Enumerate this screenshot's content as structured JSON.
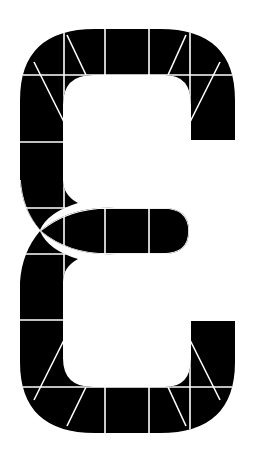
{
  "graphic": {
    "label": "Segmented epsilon glyph",
    "fill_color": "#000000",
    "line_color": "#ffffff",
    "background": "#ffffff"
  }
}
